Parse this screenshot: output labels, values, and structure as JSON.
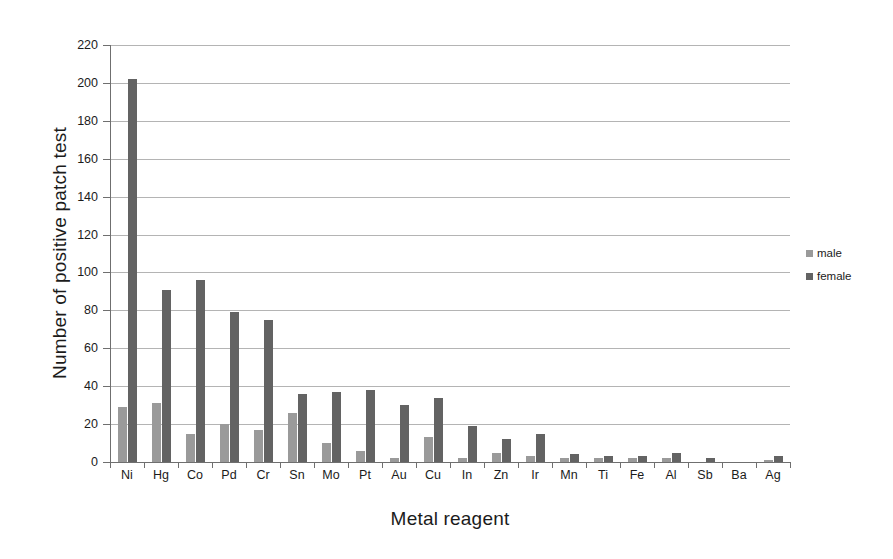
{
  "chart_data": {
    "type": "bar",
    "title": "",
    "subtitle": "",
    "xlabel": "Metal reagent",
    "ylabel": "Number of positive patch test",
    "categories": [
      "Ni",
      "Hg",
      "Co",
      "Pd",
      "Cr",
      "Sn",
      "Mo",
      "Pt",
      "Au",
      "Cu",
      "In",
      "Zn",
      "Ir",
      "Mn",
      "Ti",
      "Fe",
      "Al",
      "Sb",
      "Ba",
      "Ag"
    ],
    "series": [
      {
        "name": "male",
        "color": "#9a9a9a",
        "values": [
          29,
          31,
          15,
          20,
          17,
          26,
          10,
          6,
          2,
          13,
          2,
          5,
          3,
          2,
          2,
          2,
          2,
          0,
          0,
          1
        ]
      },
      {
        "name": "female",
        "color": "#636363",
        "values": [
          202,
          91,
          96,
          79,
          75,
          36,
          37,
          38,
          30,
          34,
          19,
          12,
          15,
          4,
          3,
          3,
          5,
          2,
          0,
          3
        ]
      }
    ],
    "ylim": [
      0,
      220
    ],
    "yticks": [
      0,
      20,
      40,
      60,
      80,
      100,
      120,
      140,
      160,
      180,
      200,
      220
    ],
    "ytick_labels": [
      "0",
      "20",
      "40",
      "60",
      "80",
      "100",
      "120",
      "140",
      "160",
      "180",
      "200",
      "220"
    ],
    "grid": true,
    "grid_axis": "y",
    "legend_position": "right",
    "legend_entries": [
      "male",
      "female"
    ]
  },
  "colors": {
    "male": "#9a9a9a",
    "female": "#636363",
    "gridline": "#b4b4b4",
    "axis": "#6f6f6f",
    "background": "#ffffff",
    "text": "#1b1b1b"
  }
}
